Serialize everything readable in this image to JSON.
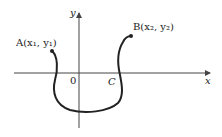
{
  "diagram": {
    "labels": {
      "point_a": "A(x₁, y₁)",
      "point_b": "B(x₂, y₂)",
      "point_c": "C",
      "origin": "0",
      "x_axis": "x",
      "y_axis": "y"
    },
    "colors": {
      "ink": "#222222",
      "axis": "#444444"
    }
  }
}
